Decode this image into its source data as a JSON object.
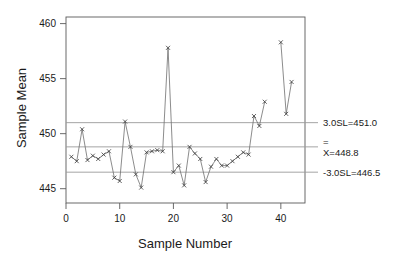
{
  "chart_data": {
    "type": "line",
    "title": "",
    "xlabel": "Sample Number",
    "ylabel": "Sample Mean",
    "xlim": [
      0,
      44.5
    ],
    "ylim": [
      443.7,
      460.6
    ],
    "xticks": [
      0,
      10,
      20,
      30,
      40
    ],
    "xtick_labels": [
      "0",
      "10",
      "20",
      "30",
      "40"
    ],
    "yticks": [
      445,
      450,
      455,
      460
    ],
    "ytick_labels": [
      "445",
      "450",
      "455",
      "460"
    ],
    "grid": false,
    "legend": "none",
    "marker": "x",
    "series": [
      {
        "name": "Sample Mean",
        "x": [
          1,
          2,
          3,
          4,
          5,
          6,
          7,
          8,
          9,
          10,
          11,
          12,
          13,
          14,
          15,
          16,
          17,
          18,
          19,
          20,
          21,
          22,
          23,
          24,
          25,
          26,
          27,
          28,
          29,
          30,
          31,
          32,
          33,
          34,
          35,
          36,
          37
        ],
        "values": [
          447.9,
          447.5,
          450.4,
          447.6,
          448.0,
          447.7,
          448.1,
          448.4,
          446.0,
          445.7,
          451.1,
          448.8,
          446.3,
          445.1,
          448.3,
          448.4,
          448.5,
          448.4,
          457.8,
          446.5,
          447.1,
          445.3,
          448.8,
          448.2,
          447.7,
          445.6,
          447.0,
          447.7,
          447.1,
          447.1,
          447.5,
          447.9,
          448.3,
          448.1,
          451.6,
          450.7,
          452.9
        ],
        "gap_after": 37
      },
      {
        "name": "Sample Mean (continued)",
        "x": [
          40,
          41,
          42
        ],
        "values": [
          458.3,
          451.8,
          454.7
        ]
      }
    ],
    "control_limits": [
      {
        "name": "upper-control-limit",
        "value": 451.0,
        "label": "3.0SL=451.0"
      },
      {
        "name": "center-line",
        "value": 448.8,
        "label": "X=448.8",
        "overbar": "="
      },
      {
        "name": "lower-control-limit",
        "value": 446.5,
        "label": "-3.0SL=446.5"
      }
    ],
    "colors": {
      "series_line": "#6e6e6e",
      "marker": "#3a3a3a",
      "limit_line": "#9a9a9a",
      "axis": "#5a5a5a",
      "text": "#1a1a1a",
      "background": "#ffffff"
    }
  }
}
